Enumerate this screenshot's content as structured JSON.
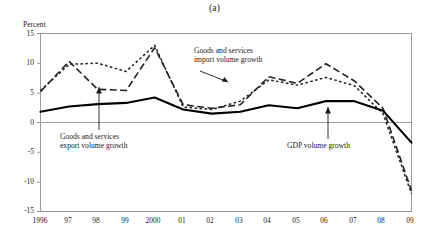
{
  "chart_data": {
    "type": "line",
    "title": "(a)",
    "xlabel": "",
    "ylabel": "Percent",
    "ylim": [
      -15,
      15
    ],
    "ytick_values": [
      15,
      10,
      5,
      0,
      -5,
      -10,
      -15
    ],
    "ytick_labels": [
      "15",
      "10",
      "5",
      "0",
      "-5",
      "-10",
      "-15"
    ],
    "grid": false,
    "zero_line": 0,
    "legend_position": "inline-annotations",
    "x": [
      1996,
      1997,
      1998,
      1999,
      2000,
      2001,
      2002,
      2003,
      2004,
      2005,
      2006,
      2007,
      2008,
      2009
    ],
    "categories": [
      "1996",
      "97",
      "98",
      "99",
      "2000",
      "01",
      "02",
      "03",
      "04",
      "05",
      "06",
      "07",
      "08",
      "09"
    ],
    "series": [
      {
        "name": "GDP volume growth",
        "style": "solid",
        "color": "#000000",
        "values": [
          1.8,
          2.7,
          3.1,
          3.3,
          4.2,
          2.2,
          1.5,
          1.8,
          2.9,
          2.4,
          3.6,
          3.6,
          2.0,
          -3.4
        ]
      },
      {
        "name": "Goods and services export volume growth",
        "style": "dashed",
        "color": "#222222",
        "values": [
          5.2,
          10.3,
          5.6,
          5.4,
          12.6,
          3.0,
          2.4,
          3.0,
          7.7,
          6.6,
          9.9,
          7.0,
          2.4,
          -11.5
        ]
      },
      {
        "name": "Goods and services import volume growth",
        "style": "dotted",
        "color": "#222222",
        "values": [
          5.4,
          9.8,
          10.0,
          8.6,
          13.0,
          2.6,
          2.2,
          3.6,
          7.2,
          6.3,
          7.6,
          6.2,
          1.5,
          -12.0
        ]
      }
    ],
    "annotations": [
      {
        "id": "import-annotation",
        "text_lines": [
          "Goods and services",
          "import volume growth"
        ],
        "points_to_series": "Goods and services import volume growth"
      },
      {
        "id": "export-annotation",
        "text_lines": [
          "Goods and services",
          "export volume growth"
        ],
        "points_to_series": "Goods and services export volume growth"
      },
      {
        "id": "gdp-annotation",
        "text_lines": [
          "GDP volume growth"
        ],
        "points_to_series": "GDP volume growth"
      }
    ]
  },
  "axis": {
    "y_title": "Percent"
  }
}
